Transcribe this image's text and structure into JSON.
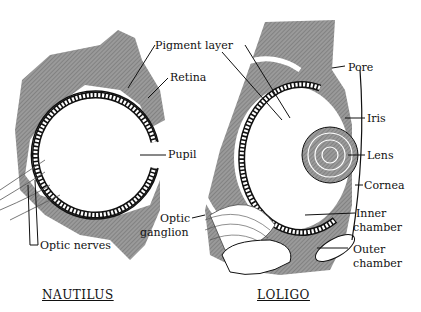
{
  "diagram": {
    "colors": {
      "tissue": "#8a8a8a",
      "line": "#111111",
      "background": "#ffffff"
    },
    "nautilus": {
      "title": "NAUTILUS",
      "labels": {
        "pigment_layer": "Pigment layer",
        "retina": "Retina",
        "pupil": "Pupil",
        "optic_nerves": "Optic nerves"
      }
    },
    "loligo": {
      "title": "LOLIGO",
      "labels": {
        "pore": "Pore",
        "iris": "Iris",
        "lens": "Lens",
        "cornea": "Cornea",
        "inner_chamber_1": "Inner",
        "inner_chamber_2": "chamber",
        "outer_chamber_1": "Outer",
        "outer_chamber_2": "chamber",
        "optic_ganglion_1": "Optic",
        "optic_ganglion_2": "ganglion"
      }
    }
  }
}
